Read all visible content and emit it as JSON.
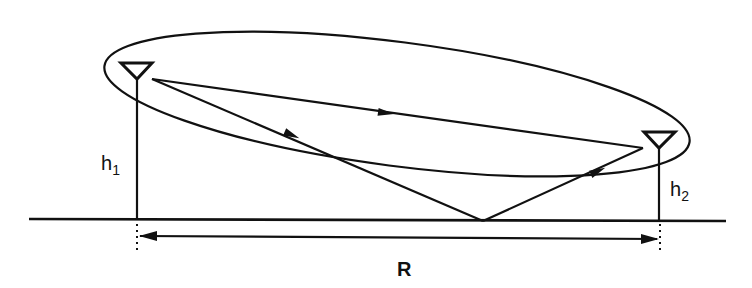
{
  "diagram": {
    "labels": {
      "h1": "h",
      "h1_sub": "1",
      "h2": "h",
      "h2_sub": "2",
      "range": "R"
    },
    "elements": [
      "ground-line",
      "transmit-antenna",
      "receive-antenna",
      "direct-ray",
      "reflected-ray",
      "fresnel-ellipse",
      "range-dimension-arrow"
    ],
    "colors": {
      "stroke": "#111111",
      "background": "#ffffff"
    }
  }
}
